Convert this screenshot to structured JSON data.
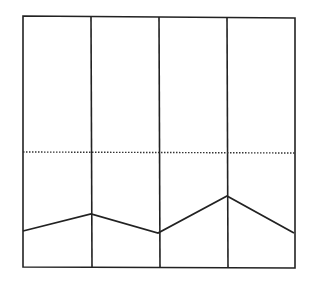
{
  "diagram": {
    "stroke_color": "#222222",
    "background": "#ffffff",
    "frame": {
      "x1": 23,
      "y1": 17,
      "x2": 295,
      "y2": 268
    },
    "dividers_x": [
      91,
      159,
      227
    ],
    "dotted_line_y": 152,
    "polyline_points": [
      [
        23,
        231
      ],
      [
        91,
        214
      ],
      [
        158,
        233
      ],
      [
        227,
        196
      ],
      [
        294,
        233
      ]
    ]
  }
}
